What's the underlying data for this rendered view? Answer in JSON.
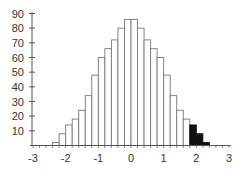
{
  "chart_data": {
    "type": "bar",
    "title": "",
    "xlabel": "",
    "ylabel": "",
    "bin_width": 0.2,
    "bin_edges": [
      -2.4,
      -2.2,
      -2.0,
      -1.8,
      -1.6,
      -1.4,
      -1.2,
      -1.0,
      -0.8,
      -0.6,
      -0.4,
      -0.2,
      0.0,
      0.2,
      0.4,
      0.6,
      0.8,
      1.0,
      1.2,
      1.4,
      1.6,
      1.8,
      2.0,
      2.2,
      2.4
    ],
    "values": [
      2,
      8,
      14,
      18,
      24,
      34,
      48,
      60,
      66,
      72,
      80,
      86,
      86,
      80,
      72,
      66,
      60,
      48,
      34,
      24,
      18,
      14,
      8,
      2
    ],
    "highlighted_bins": [
      21,
      22,
      23
    ],
    "highlight_note": "Bins from 1.8 to 2.4 are filled black (upper tail region)",
    "xlim": [
      -3,
      3
    ],
    "ylim": [
      0,
      90
    ],
    "x_ticks": [
      -3,
      -2,
      -1,
      0,
      1,
      2,
      3
    ],
    "x_tick_labels": [
      "-3",
      "-2",
      "-1",
      "0",
      "1",
      "2",
      "3"
    ],
    "y_ticks": [
      10,
      20,
      30,
      40,
      50,
      60,
      70,
      80,
      90
    ],
    "y_tick_labels": [
      "10",
      "20",
      "30",
      "40",
      "50",
      "60",
      "70",
      "80",
      "90"
    ],
    "grid": false,
    "legend": null,
    "colors": {
      "bar_fill": "#ffffff",
      "bar_stroke": "#777777",
      "highlight_fill": "#111111",
      "axis": "#555555"
    }
  }
}
